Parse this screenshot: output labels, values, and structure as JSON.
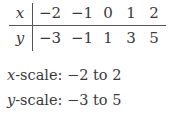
{
  "table": {
    "row_labels": [
      "x",
      "y"
    ],
    "x_values": [
      "−2",
      "−1",
      "0",
      "1",
      "2"
    ],
    "y_values": [
      "−3",
      "−1",
      "1",
      "3",
      "5"
    ]
  },
  "scales": {
    "x": {
      "var": "x",
      "text": "-scale: −2 to 2"
    },
    "y": {
      "var": "y",
      "text": "-scale: −3 to 5"
    }
  }
}
